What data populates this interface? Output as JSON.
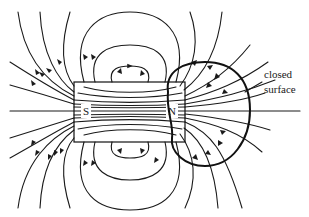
{
  "figure": {
    "magnet": {
      "south_label": "S",
      "north_label": "N"
    },
    "annotation": {
      "line1": "closed",
      "line2": "surface"
    },
    "colors": {
      "ink": "#1a1a1a",
      "background": "#ffffff"
    }
  }
}
